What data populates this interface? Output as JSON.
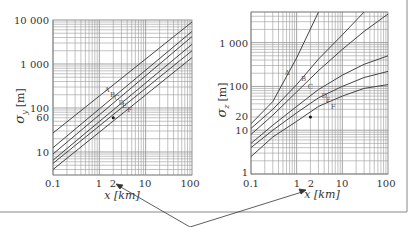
{
  "chart_data": [
    {
      "type": "line",
      "title": "",
      "xlabel": "x [km]",
      "ylabel": "σy [m]",
      "xscale": "log",
      "yscale": "log",
      "xlim": [
        0.1,
        100
      ],
      "ylim": [
        3,
        10000
      ],
      "x_ticks": [
        "0.1",
        "1",
        "2",
        "10",
        "100"
      ],
      "y_ticks": [
        "10",
        "60",
        "100",
        "1 000",
        "10 000"
      ],
      "grid": true,
      "x": [
        0.1,
        100
      ],
      "series": [
        {
          "name": "A",
          "values": [
            27,
            9000
          ]
        },
        {
          "name": "B",
          "values": [
            12.5,
            5500
          ]
        },
        {
          "name": "C",
          "values": [
            9,
            4200
          ]
        },
        {
          "name": "D",
          "values": [
            6.5,
            2800
          ]
        },
        {
          "name": "E",
          "values": [
            5.5,
            2000
          ]
        },
        {
          "name": "F",
          "values": [
            4,
            1400
          ]
        }
      ],
      "annotations": [
        {
          "label": "A",
          "x": 1.3,
          "y": 230
        },
        {
          "label": "B",
          "x": 1.7,
          "y": 180
        },
        {
          "label": "C",
          "x": 2.1,
          "y": 150
        },
        {
          "label": "D",
          "x": 2.6,
          "y": 120
        },
        {
          "label": "E",
          "x": 3.1,
          "y": 100
        },
        {
          "label": "F",
          "x": 4.0,
          "y": 80
        },
        {
          "label": "point",
          "x": 2,
          "y": 60
        }
      ]
    },
    {
      "type": "line",
      "title": "",
      "xlabel": "x [km]",
      "ylabel": "σz [m]",
      "xscale": "log",
      "yscale": "log",
      "xlim": [
        0.1,
        100
      ],
      "ylim": [
        1,
        5000
      ],
      "x_ticks": [
        "0.1",
        "1",
        "2",
        "10",
        "100"
      ],
      "y_ticks": [
        "1",
        "10",
        "20",
        "100",
        "1 000"
      ],
      "grid": true,
      "x": [
        0.1,
        0.3,
        1,
        3,
        10,
        30,
        100
      ],
      "series": [
        {
          "name": "A",
          "values": [
            14,
            45,
            450,
            5000,
            null,
            null,
            null
          ]
        },
        {
          "name": "B",
          "values": [
            11,
            30,
            110,
            420,
            1500,
            5000,
            null
          ]
        },
        {
          "name": "C",
          "values": [
            8,
            22,
            75,
            230,
            700,
            1800,
            4500
          ]
        },
        {
          "name": "D",
          "values": [
            5,
            13,
            35,
            85,
            180,
            320,
            500
          ]
        },
        {
          "name": "E",
          "values": [
            4,
            10,
            25,
            55,
            100,
            160,
            220
          ]
        },
        {
          "name": "F",
          "values": [
            2.5,
            7,
            16,
            35,
            60,
            90,
            110
          ]
        }
      ],
      "annotations": [
        {
          "label": "A",
          "x": 0.55,
          "y": 180
        },
        {
          "label": "B",
          "x": 1.25,
          "y": 130
        },
        {
          "label": "C",
          "x": 1.75,
          "y": 85
        },
        {
          "label": "D",
          "x": 3.5,
          "y": 55
        },
        {
          "label": "E",
          "x": 4.3,
          "y": 45
        },
        {
          "label": "F",
          "x": 5.6,
          "y": 30
        },
        {
          "label": "point",
          "x": 2,
          "y": 20
        }
      ]
    }
  ],
  "left": {
    "ylabel_main": "σ",
    "ylabel_sub": "y",
    "ylabel_unit": "[m]",
    "xlabel": "x [km]",
    "yticks": [
      "10 000",
      "1 000",
      "100",
      "60",
      "10"
    ],
    "xticks": [
      "0.1",
      "1",
      "2",
      "10",
      "100"
    ],
    "curve_labels": [
      "A",
      "B",
      "C",
      "D",
      "E",
      "F"
    ]
  },
  "right": {
    "ylabel_main": "σ",
    "ylabel_sub": "z",
    "ylabel_unit": "[m]",
    "xlabel": "x [km]",
    "yticks": [
      "1 000",
      "100",
      "20",
      "10",
      "1"
    ],
    "xticks": [
      "0.1",
      "1",
      "2",
      "10",
      "100"
    ],
    "curve_labels": [
      "A",
      "B",
      "C",
      "D",
      "E",
      "F"
    ]
  },
  "colors": {
    "grid": "#9a9a9a",
    "curve": "#444444",
    "frame": "#888888",
    "text": "#333333"
  }
}
